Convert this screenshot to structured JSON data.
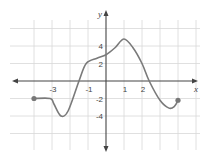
{
  "chart_data": {
    "type": "line",
    "title": "",
    "xlabel": "x",
    "ylabel": "y",
    "xlim": [
      -5.5,
      5.5
    ],
    "ylim": [
      -8,
      8
    ],
    "grid": true,
    "x_tick_labels": [
      "-3",
      "-1",
      "1",
      "2"
    ],
    "y_tick_labels": [
      "4",
      "2",
      "-2",
      "-4"
    ],
    "x_ticks": [
      -3,
      -1,
      1,
      2
    ],
    "y_ticks": [
      4,
      2,
      -2,
      -4
    ],
    "grid_x_step": 1,
    "grid_y_step": 2,
    "series": [
      {
        "name": "f(x)",
        "closed_endpoints": [
          [
            -4,
            -2
          ],
          [
            4,
            -2.2
          ]
        ],
        "points": [
          [
            -4,
            -2
          ],
          [
            -3.1,
            -2
          ],
          [
            -2.9,
            -2.6
          ],
          [
            -2.5,
            -4
          ],
          [
            -2.1,
            -3.4
          ],
          [
            -1.5,
            0
          ],
          [
            -1.1,
            2
          ],
          [
            -0.5,
            2.6
          ],
          [
            0,
            3
          ],
          [
            0.5,
            3.8
          ],
          [
            1,
            4.8
          ],
          [
            1.5,
            3.8
          ],
          [
            2,
            2
          ],
          [
            2.4,
            0
          ],
          [
            3,
            -2.2
          ],
          [
            3.5,
            -3.1
          ],
          [
            3.8,
            -2.9
          ],
          [
            4,
            -2.2
          ]
        ]
      }
    ]
  },
  "labels": {
    "x_axis": "x",
    "y_axis": "y",
    "xt": [
      "-3",
      "-1",
      "1",
      "2"
    ],
    "yt": [
      "4",
      "2",
      "-2",
      "-4"
    ]
  },
  "colors": {
    "curve": "#7a7a7a",
    "axis": "#444444",
    "grid": "#d8d8d8",
    "dot": "#777777"
  }
}
